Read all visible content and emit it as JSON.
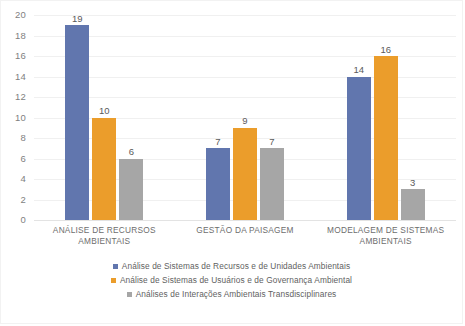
{
  "chart_data": {
    "type": "bar",
    "title": "",
    "subtitle": "",
    "xlabel": "",
    "ylabel": "",
    "ylim": [
      0,
      20
    ],
    "yticks": [
      20,
      18,
      16,
      14,
      12,
      10,
      8,
      6,
      4,
      2,
      0
    ],
    "grid": true,
    "legend_position": "bottom",
    "categories": [
      "ANÁLISE DE RECURSOS AMBIENTAIS",
      "GESTÃO DA PAISAGEM",
      "MODELAGEM DE SISTEMAS AMBIENTAIS"
    ],
    "series": [
      {
        "name": "Análise de Sistemas de Recursos e de Unidades Ambientais",
        "color": "#6176ae",
        "values": [
          19,
          7,
          14
        ]
      },
      {
        "name": "Análise de Sistemas de Usuários e de Governança Ambiental",
        "color": "#eb9d2b",
        "values": [
          10,
          9,
          16
        ]
      },
      {
        "name": "Análises de Interações Ambientais Transdisciplinares",
        "color": "#a6a6a6",
        "values": [
          6,
          7,
          3
        ]
      }
    ]
  },
  "axis": {
    "y_tick_labels": [
      "20",
      "18",
      "16",
      "14",
      "12",
      "10",
      "8",
      "6",
      "4",
      "2",
      "0"
    ]
  },
  "categories": [
    {
      "line1": "ANÁLISE DE RECURSOS",
      "line2": "AMBIENTAIS"
    },
    {
      "line1": "GESTÃO DA PAISAGEM",
      "line2": ""
    },
    {
      "line1": "MODELAGEM DE SISTEMAS",
      "line2": "AMBIENTAIS"
    }
  ],
  "bar_labels": {
    "g0": [
      "19",
      "10",
      "6"
    ],
    "g1": [
      "7",
      "9",
      "7"
    ],
    "g2": [
      "14",
      "16",
      "3"
    ]
  },
  "legend": {
    "items": [
      {
        "label": "Análise de Sistemas de Recursos e de Unidades Ambientais",
        "color": "#6176ae"
      },
      {
        "label": "Análise de Sistemas de Usuários e de Governança Ambiental",
        "color": "#eb9d2b"
      },
      {
        "label": "Análises de Interações Ambientais Transdisciplinares",
        "color": "#a6a6a6"
      }
    ]
  }
}
